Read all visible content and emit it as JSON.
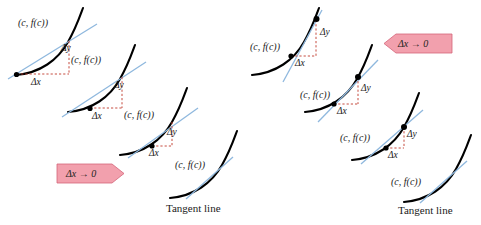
{
  "figure": {
    "background_color": "#ffffff",
    "curve_color": "#000000",
    "secant_color": "#8fb8de",
    "tangent_color": "#8fb8de",
    "dash_color": "#c0392b",
    "banner_fill": "#f2a0ad",
    "banner_stroke": "#d4647a",
    "point_label": "(c, f(c))",
    "delta_y_label": "Δy",
    "delta_x_label": "Δx",
    "tangent_label": "Tangent line",
    "limit_label": "Δx → 0"
  },
  "panels": [
    {
      "name": "left-panel",
      "direction": "right",
      "banner_label": "Δx → 0",
      "tangent_label": "Tangent line",
      "steps": [
        {
          "index": 1,
          "point_label": "(c, f(c))",
          "delta_y_label": "Δy",
          "delta_x_label": "Δx",
          "has_deltas": true,
          "has_tangent_label": false
        },
        {
          "index": 2,
          "point_label": "(c, f(c))",
          "delta_y_label": "Δy",
          "delta_x_label": "Δx",
          "has_deltas": true,
          "has_tangent_label": false
        },
        {
          "index": 3,
          "point_label": "(c, f(c))",
          "delta_y_label": "Δy",
          "delta_x_label": "Δx",
          "has_deltas": true,
          "has_tangent_label": false
        },
        {
          "index": 4,
          "point_label": "(c, f(c))",
          "delta_y_label": "",
          "delta_x_label": "",
          "has_deltas": false,
          "has_tangent_label": true
        }
      ]
    },
    {
      "name": "right-panel",
      "direction": "left",
      "banner_label": "Δx → 0",
      "tangent_label": "Tangent line",
      "steps": [
        {
          "index": 1,
          "point_label": "(c, f(c))",
          "delta_y_label": "Δy",
          "delta_x_label": "Δx",
          "has_deltas": true,
          "has_tangent_label": false
        },
        {
          "index": 2,
          "point_label": "(c, f(c))",
          "delta_y_label": "Δy",
          "delta_x_label": "Δx",
          "has_deltas": true,
          "has_tangent_label": false
        },
        {
          "index": 3,
          "point_label": "(c, f(c))",
          "delta_y_label": "Δy",
          "delta_x_label": "Δx",
          "has_deltas": true,
          "has_tangent_label": false
        },
        {
          "index": 4,
          "point_label": "(c, f(c))",
          "delta_y_label": "",
          "delta_x_label": "",
          "has_deltas": false,
          "has_tangent_label": true
        }
      ]
    }
  ]
}
